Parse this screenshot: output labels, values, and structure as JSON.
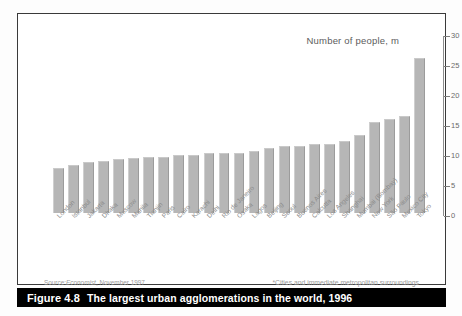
{
  "figure": {
    "caption_number": "Figure 4.8",
    "caption_text": "The largest urban agglomerations in the world, 1996",
    "source_prefix": "Source:",
    "source_publication": "Economist",
    "source_date": ", November 1997",
    "footnote": "*Cities and immediate metropolitan surroundings",
    "bar_color": "#b6b6b6",
    "caption_bg": "#000000",
    "frame_color": "#3a3a3a"
  },
  "chart_data": {
    "type": "bar",
    "title": "Number of people, m",
    "xlabel": "",
    "ylabel": "Number of people, m",
    "ylim": [
      0,
      30
    ],
    "yticks": [
      0,
      5,
      10,
      15,
      20,
      25,
      30
    ],
    "ytick_labels": [
      "0",
      "5",
      "10",
      "15",
      "20",
      "25",
      "30"
    ],
    "grid": false,
    "legend": "none",
    "axis_position": "right",
    "categories": [
      "London",
      "Istanbul",
      "Jakarta",
      "Dhaka",
      "Moscow",
      "Manila",
      "Tianjin",
      "Paris",
      "Cairo",
      "Karachi",
      "Delhi",
      "Rio de Janeiro",
      "Osaka",
      "Lagos",
      "Beijing",
      "Seoul",
      "Buenos Aires",
      "Calcutta",
      "Los Angeles",
      "Shanghai",
      "Mumbai (Bombay)",
      "New York",
      "São Paulo",
      "Mexico City",
      "Tokyo"
    ],
    "values": [
      7.6,
      8.0,
      8.6,
      8.8,
      9.1,
      9.3,
      9.4,
      9.4,
      9.7,
      9.7,
      10.0,
      10.0,
      10.0,
      10.4,
      10.9,
      11.2,
      11.2,
      11.5,
      11.5,
      12.0,
      13.0,
      15.3,
      15.7,
      16.3,
      16.4
    ],
    "highlight_value": 26.0,
    "highlight_category": "Tokyo"
  }
}
